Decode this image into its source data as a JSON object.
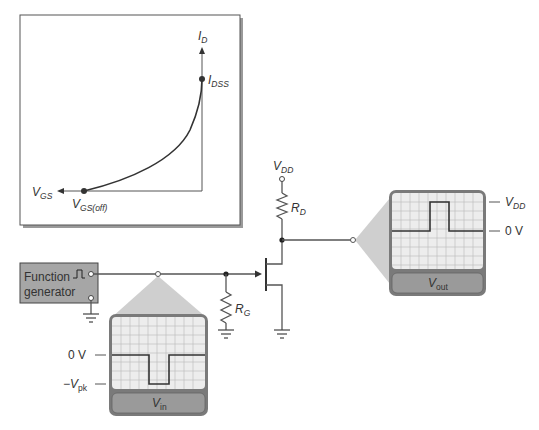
{
  "graph": {
    "title": "JFET transfer characteristic",
    "y_axis": {
      "main": "I",
      "sub": "D"
    },
    "x_axis": {
      "main": "V",
      "sub": "GS"
    },
    "point_top": {
      "main": "I",
      "sub": "DSS"
    },
    "point_bottom": {
      "main": "V",
      "sub": "GS(off)"
    }
  },
  "circuit": {
    "function_generator": {
      "line1": "Function",
      "line2": "generator"
    },
    "vdd": {
      "main": "V",
      "sub": "DD"
    },
    "rd": {
      "main": "R",
      "sub": "D"
    },
    "rg": {
      "main": "R",
      "sub": "G"
    }
  },
  "scope_in": {
    "label": {
      "main": "V",
      "sub": "in"
    },
    "level_high": "0 V",
    "level_low": {
      "prefix": "−V",
      "sub": "pk"
    }
  },
  "scope_out": {
    "label": {
      "main": "V",
      "sub": "out"
    },
    "level_high": {
      "main": "V",
      "sub": "DD"
    },
    "level_low": "0 V"
  },
  "colors": {
    "frame": "#7a7a7a",
    "screen": "#ededed",
    "grid": "#b8b8b8",
    "label_bar": "#9a9a9a",
    "probe_cone": "#cfcfcf",
    "generator_box": "#a6a6a6",
    "trace": "#333333"
  }
}
